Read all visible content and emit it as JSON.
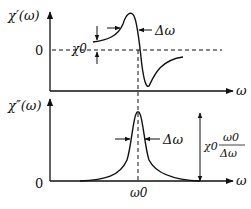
{
  "diagram": {
    "top_plot": {
      "ylabel": "χ′(ω)",
      "xlabel": "ω",
      "zero_label": "0",
      "amplitude_label": "χ0",
      "width_label": "Δω",
      "curve": "dispersion (real part)"
    },
    "bottom_plot": {
      "ylabel": "χ″(ω)",
      "xlabel": "ω",
      "zero_label": "0",
      "center_label": "ω0",
      "width_label": "Δω",
      "peak_label_prefix": "χ0",
      "peak_label_num": "ω0",
      "peak_label_den": "Δω",
      "curve": "absorption (imaginary part, Lorentzian)"
    },
    "colors": {
      "line": "#111111",
      "background": "#ffffff"
    }
  }
}
